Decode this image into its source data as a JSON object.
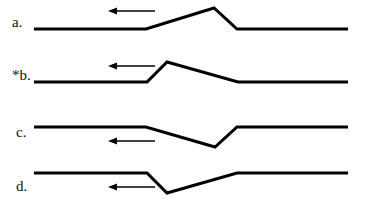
{
  "diagram": {
    "colors": {
      "line": "#000000",
      "background": "#ffffff",
      "text": "#111111"
    },
    "panels": [
      {
        "id": "a",
        "label": "a.",
        "label_pos": [
          12,
          27
        ],
        "arrow": {
          "direction": "left",
          "y": 11,
          "x_from": 155,
          "x_to": 108
        },
        "points": "34,29 146,29 214,8 237,29 348,29",
        "shape": "gradual rise, steep fall (upward)"
      },
      {
        "id": "b",
        "label": "*b.",
        "label_pos": [
          12,
          80
        ],
        "arrow": {
          "direction": "left",
          "y": 66,
          "x_from": 155,
          "x_to": 108
        },
        "points": "34,82 147,82 167,62 238,82 348,82",
        "shape": "steep rise, gradual fall (upward)"
      },
      {
        "id": "c",
        "label": "c.",
        "label_pos": [
          16,
          137
        ],
        "arrow": {
          "direction": "left",
          "y": 141,
          "x_from": 155,
          "x_to": 108
        },
        "points": "34,127 146,127 215,147 237,127 348,127",
        "shape": "gradual fall, steep rise (downward)"
      },
      {
        "id": "d",
        "label": "d.",
        "label_pos": [
          16,
          191
        ],
        "arrow": {
          "direction": "left",
          "y": 187,
          "x_from": 155,
          "x_to": 108
        },
        "points": "34,173 147,173 167,193 237,173 348,173",
        "shape": "steep fall, gradual rise (downward)"
      }
    ]
  }
}
